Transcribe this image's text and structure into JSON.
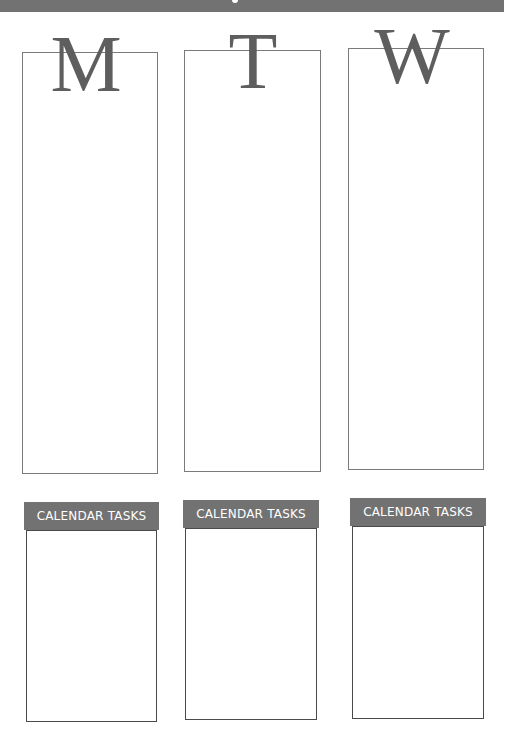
{
  "page": {
    "header_bar_color": "#727272",
    "days": [
      {
        "letter": "M",
        "tasks_label": "CALENDAR TASKS"
      },
      {
        "letter": "T",
        "tasks_label": "CALENDAR TASKS"
      },
      {
        "letter": "W",
        "tasks_label": "CALENDAR TASKS"
      }
    ]
  }
}
